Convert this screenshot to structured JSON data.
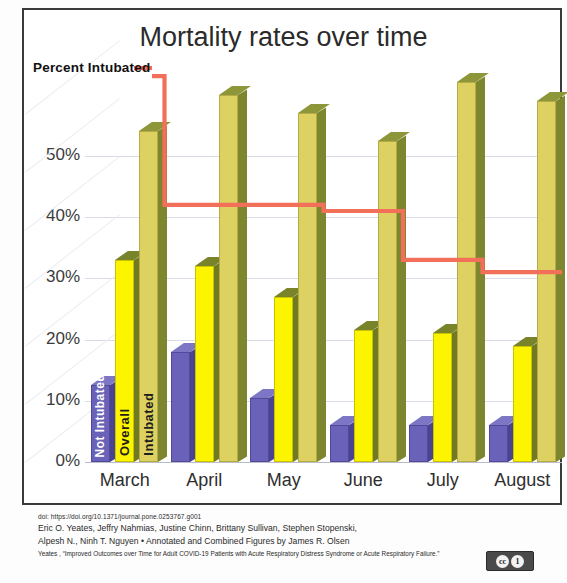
{
  "figure": {
    "title": "Mortality rates over time",
    "annotation_label": "Percent Intubated",
    "license_icon": "creative-commons-by-icon",
    "cc_marks": [
      "cc",
      "1"
    ]
  },
  "caption": {
    "doi": "doi: https://doi.org/10.1371/journal.pone.0253767.g001",
    "authors_line1": "Eric O. Yeates, Jeffry Nahmias, Justine Chinn, Brittany Sullivan, Stephen Stopenski,",
    "authors_line2": "Alpesh N., Ninh T. Nguyen • Annotated and Combined Figures by James R. Olsen",
    "source_line": "Yeates , “Improved Outcomes over Time for Adult COVID-19 Patients with Acute Respiratory Distress Syndrome or Acute Respiratory Failure.”"
  },
  "chart_data": {
    "type": "bar",
    "title": "Mortality rates over time",
    "xlabel": "",
    "ylabel": "",
    "categories": [
      "March",
      "April",
      "May",
      "June",
      "July",
      "August"
    ],
    "ylim": [
      0,
      65
    ],
    "ytick_labels": [
      "0%",
      "10%",
      "20%",
      "30%",
      "40%",
      "50%"
    ],
    "ytick_values": [
      0,
      10,
      20,
      30,
      40,
      50
    ],
    "grid": true,
    "legend": "in-bar labels",
    "series": [
      {
        "name": "Not Intubated",
        "color": "#6a62b8",
        "values": [
          12.5,
          18.0,
          10.5,
          6.0,
          6.0,
          6.0
        ]
      },
      {
        "name": "Overall",
        "color": "#fdf500",
        "values": [
          33.0,
          32.0,
          27.0,
          21.5,
          21.0,
          19.0
        ]
      },
      {
        "name": "Intubated",
        "color": "#ddd261",
        "values": [
          54.0,
          60.0,
          57.0,
          52.5,
          62.0,
          59.0
        ]
      }
    ],
    "overlay_line": {
      "name": "Percent Intubated",
      "type": "step",
      "color": "#f2705a",
      "values": [
        63.0,
        42.0,
        42.0,
        41.0,
        33.0,
        31.0
      ]
    },
    "bar_inline_labels": [
      "Not Intubated",
      "Overall",
      "Intubated"
    ]
  }
}
